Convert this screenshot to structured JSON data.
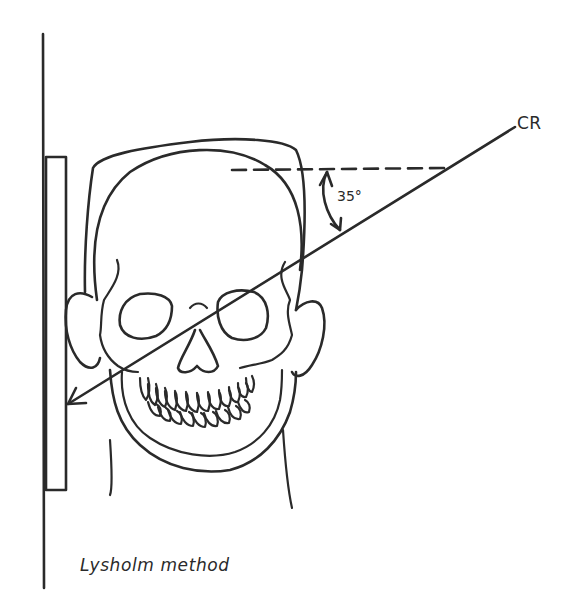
{
  "diagram": {
    "title": "Lysholm method",
    "central_ray_label": "CR",
    "angle_label": "35°",
    "angle_degrees": 35,
    "elements": [
      "image-receptor",
      "skull-frontal-view",
      "central-ray-arrow",
      "horizontal-reference-dashed-line",
      "angle-arc-with-arrows"
    ],
    "colors": {
      "ink": "#2a2a2a",
      "background": "#ffffff"
    }
  }
}
